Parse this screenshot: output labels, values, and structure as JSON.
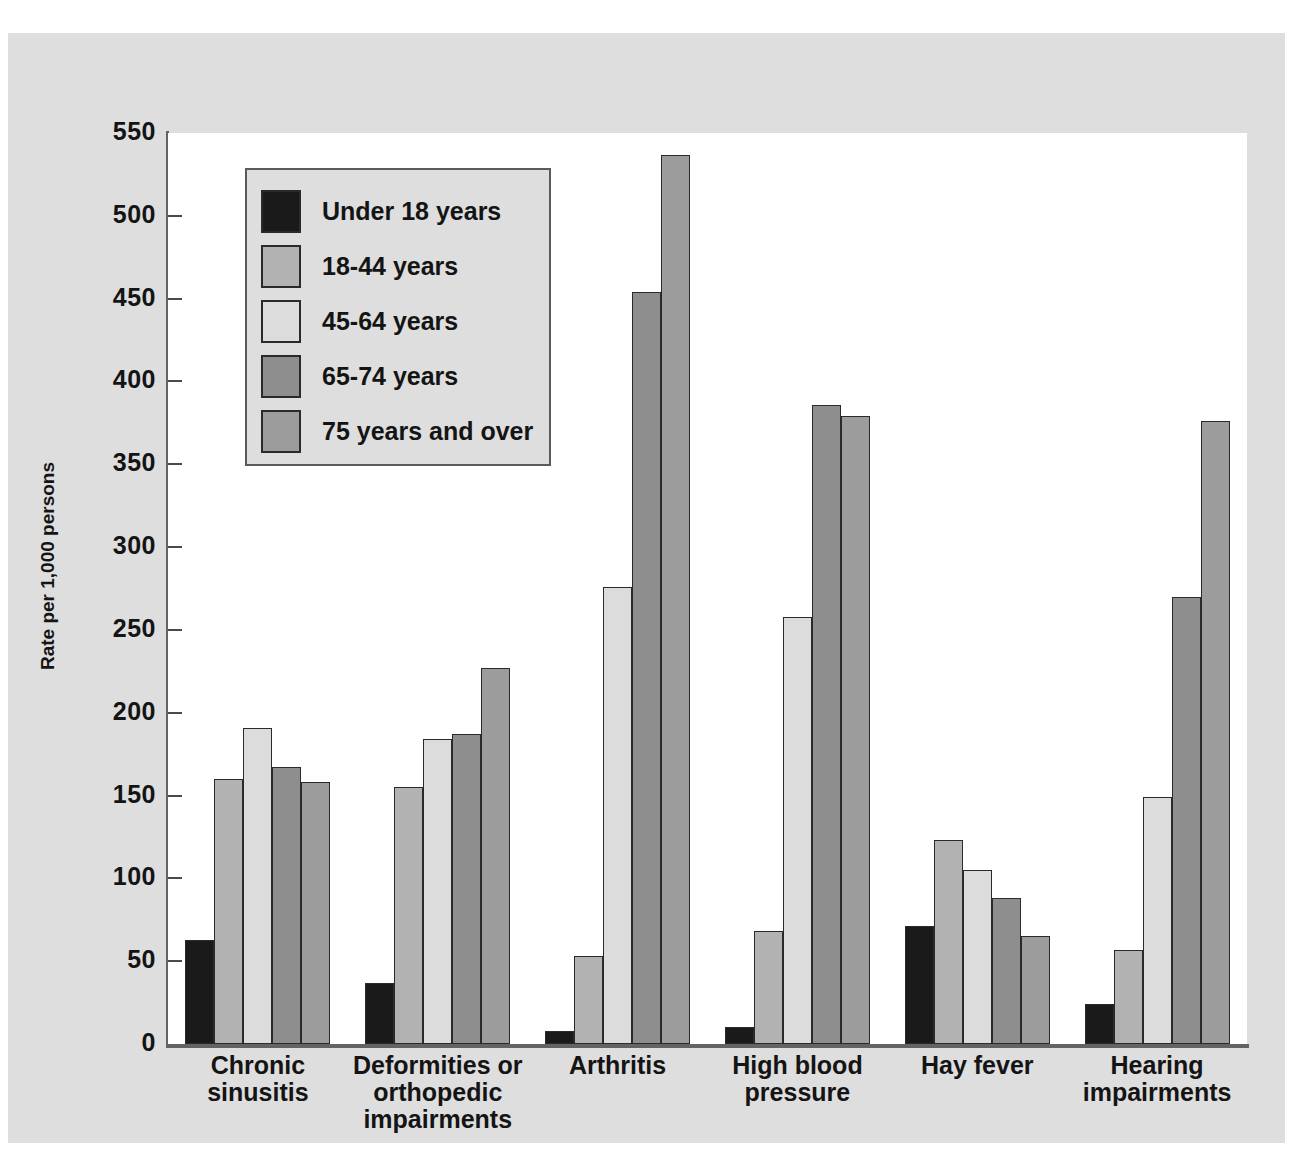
{
  "chart_data": {
    "type": "bar",
    "title": "",
    "xlabel": "",
    "ylabel": "Rate per 1,000 persons",
    "ylim": [
      0,
      550
    ],
    "yticks": [
      0,
      50,
      100,
      150,
      200,
      250,
      300,
      350,
      400,
      450,
      500,
      550
    ],
    "grid": false,
    "legend_position": "upper-left-inside",
    "categories": [
      "Chronic sinusitis",
      "Deformities or orthopedic impairments",
      "Arthritis",
      "High blood pressure",
      "Hay fever",
      "Hearing impairments"
    ],
    "category_lines": [
      [
        "Chronic",
        "sinusitis"
      ],
      [
        "Deformities or",
        "orthopedic",
        "impairments"
      ],
      [
        "Arthritis"
      ],
      [
        "High blood",
        "pressure"
      ],
      [
        "Hay fever"
      ],
      [
        "Hearing",
        "impairments"
      ]
    ],
    "series": [
      {
        "name": "Under 18 years",
        "color": "#1a1a1a",
        "values": [
          63,
          37,
          8,
          10,
          71,
          24
        ]
      },
      {
        "name": "18-44 years",
        "color": "#b2b2b2",
        "values": [
          160,
          155,
          53,
          68,
          123,
          57
        ]
      },
      {
        "name": "45-64 years",
        "color": "#dcdcdc",
        "values": [
          191,
          184,
          276,
          258,
          105,
          149
        ]
      },
      {
        "name": "65-74 years",
        "color": "#8e8e8e",
        "values": [
          167,
          187,
          454,
          386,
          88,
          270
        ]
      },
      {
        "name": "75 years and over",
        "color": "#9c9c9c",
        "values": [
          158,
          227,
          537,
          379,
          65,
          376
        ]
      }
    ]
  },
  "legend": {
    "items": [
      {
        "label": "Under 18 years",
        "color": "#1a1a1a"
      },
      {
        "label": "18-44 years",
        "color": "#b2b2b2"
      },
      {
        "label": "45-64 years",
        "color": "#dcdcdc"
      },
      {
        "label": "65-74 years",
        "color": "#8e8e8e"
      },
      {
        "label": "75 years and over",
        "color": "#9c9c9c"
      }
    ]
  },
  "colors": {
    "page_background": "#dedede",
    "plot_background": "#ffffff",
    "axis": "#636363",
    "text": "#141414",
    "bar_outline": "#2a2a2a"
  }
}
